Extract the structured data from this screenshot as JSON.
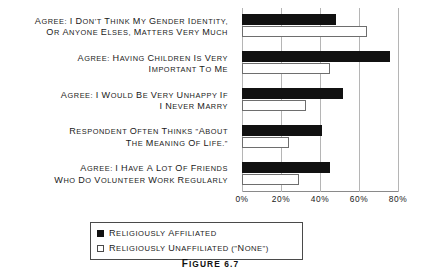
{
  "caption": "Figure 6.7",
  "legend": {
    "items": [
      {
        "label": "Religiously affiliated",
        "color": "#111111",
        "swatch": "filled-square"
      },
      {
        "label": "Religiously unaffiliated (\"none\")",
        "color": "#ffffff",
        "swatch": "open-square"
      }
    ]
  },
  "chart_data": {
    "type": "bar",
    "orientation": "horizontal",
    "title": "",
    "xlabel": "",
    "ylabel": "",
    "xlim": [
      0,
      80
    ],
    "xticks": [
      "0%",
      "20%",
      "40%",
      "60%",
      "80%"
    ],
    "xtick_values": [
      0,
      20,
      40,
      60,
      80
    ],
    "grid": true,
    "grid_axis": "x",
    "legend_position": "bottom",
    "categories": [
      "Agree: I don't think my gender identity, or anyone elses, matters very much",
      "Agree: having children is very important to me",
      "Agree: I would be very unhappy if I never marry",
      "Respondent often thinks \"about the meaning of life.\"",
      "Agree: I have a lot of friends who do volunteer work regularly"
    ],
    "category_lines": [
      [
        "Agree: I don't think my gender identity,",
        "or anyone elses, matters very much"
      ],
      [
        "Agree: having children is very",
        "important to me"
      ],
      [
        "Agree: I would be very unhappy if",
        "I never marry"
      ],
      [
        "Respondent often thinks \"about",
        "the meaning of life.\""
      ],
      [
        "Agree: I have a lot of friends",
        "who do volunteer work regularly"
      ]
    ],
    "series": [
      {
        "name": "Religiously affiliated",
        "color": "#111111",
        "values": [
          48,
          76,
          52,
          41,
          45
        ]
      },
      {
        "name": "Religiously unaffiliated (\"none\")",
        "color": "#ffffff",
        "values": [
          64,
          45,
          33,
          24,
          29
        ]
      }
    ]
  }
}
